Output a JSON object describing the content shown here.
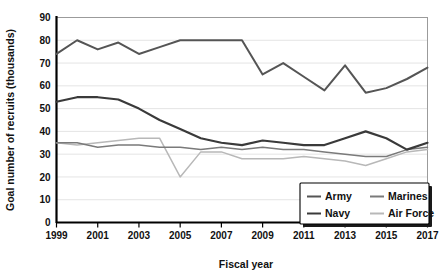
{
  "chart_data": {
    "type": "line",
    "title": "",
    "xlabel": "Fiscal year",
    "ylabel": "Goal number of recruits (thousands)",
    "xlim": [
      1999,
      2017
    ],
    "ylim": [
      0,
      90
    ],
    "ytick_step": 10,
    "xtick_step": 1,
    "xtick_label_step": 2,
    "grid": true,
    "legend_position": "bottom-right",
    "x": [
      1999,
      2000,
      2001,
      2002,
      2003,
      2004,
      2005,
      2006,
      2007,
      2008,
      2009,
      2010,
      2011,
      2012,
      2013,
      2014,
      2015,
      2016,
      2017
    ],
    "xtick_labels": [
      "1999",
      "",
      "2001",
      "",
      "2003",
      "",
      "2005",
      "",
      "2007",
      "",
      "2009",
      "",
      "2011",
      "",
      "2013",
      "",
      "2015",
      "",
      "2017"
    ],
    "ytick_labels": [
      "0",
      "10",
      "20",
      "30",
      "40",
      "50",
      "60",
      "70",
      "80",
      "90"
    ],
    "series": [
      {
        "name": "Army",
        "color": "#555555",
        "width": 2.0,
        "values": [
          74,
          80,
          76,
          79,
          74,
          77,
          80,
          80,
          80,
          80,
          65,
          70,
          64,
          58,
          69,
          57,
          59,
          63,
          68
        ]
      },
      {
        "name": "Navy",
        "color": "#3a3a3a",
        "width": 2.2,
        "values": [
          53,
          55,
          55,
          54,
          50,
          45,
          41,
          37,
          35,
          34,
          36,
          35,
          34,
          34,
          37,
          40,
          37,
          32,
          35
        ]
      },
      {
        "name": "Marines",
        "color": "#7a7a7a",
        "width": 1.5,
        "values": [
          35,
          35,
          33,
          34,
          34,
          33,
          33,
          32,
          33,
          32,
          33,
          32,
          32,
          31,
          30,
          29,
          29,
          32,
          33
        ]
      },
      {
        "name": "Air Force",
        "color": "#b8b8b8",
        "width": 1.5,
        "values": [
          35,
          34,
          35,
          36,
          37,
          37,
          20,
          31,
          31,
          28,
          28,
          28,
          29,
          28,
          27,
          25,
          28,
          31,
          32
        ]
      }
    ]
  }
}
